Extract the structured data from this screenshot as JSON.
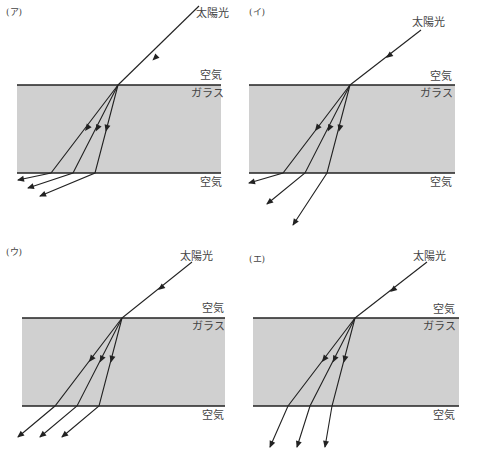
{
  "labels": {
    "sunlight": "太陽光",
    "air": "空気",
    "glass": "ガラス"
  },
  "colors": {
    "glass_fill": "#d0d0d0",
    "line": "#222222",
    "text": "#444444",
    "background": "#ffffff"
  },
  "panels": [
    {
      "id": "a",
      "label": "(ア)",
      "label_pos": [
        6,
        15
      ],
      "glass": {
        "x": 17,
        "y": 85,
        "w": 204,
        "h": 88
      },
      "incident": {
        "from": [
          199,
          6
        ],
        "to": [
          118,
          85
        ]
      },
      "incident_arrow_at": [
        156,
        57
      ],
      "sun_label_pos": [
        196,
        17
      ],
      "air_top_pos": [
        200,
        79
      ],
      "glass_label_pos": [
        191,
        97
      ],
      "air_bottom_pos": [
        200,
        186
      ],
      "rays": [
        {
          "bend": [
            51,
            173
          ],
          "end": [
            18,
            180
          ],
          "mid_arrow": [
            88,
            127
          ]
        },
        {
          "bend": [
            73,
            173
          ],
          "end": [
            28,
            188
          ],
          "mid_arrow": [
            98,
            127
          ]
        },
        {
          "bend": [
            95,
            173
          ],
          "end": [
            40,
            196
          ],
          "mid_arrow": [
            107,
            127
          ]
        }
      ]
    },
    {
      "id": "i",
      "label": "(イ)",
      "label_pos": [
        249,
        15
      ],
      "glass": {
        "x": 249,
        "y": 85,
        "w": 206,
        "h": 88
      },
      "incident": {
        "from": [
          421,
          30
        ],
        "to": [
          350,
          85
        ]
      },
      "incident_arrow_at": [
        390,
        55
      ],
      "sun_label_pos": [
        412,
        26
      ],
      "air_top_pos": [
        430,
        80
      ],
      "glass_label_pos": [
        420,
        97
      ],
      "air_bottom_pos": [
        430,
        186
      ],
      "rays": [
        {
          "bend": [
            283,
            173
          ],
          "end": [
            249,
            183
          ],
          "mid_arrow": [
            318,
            127
          ]
        },
        {
          "bend": [
            305,
            173
          ],
          "end": [
            267,
            204
          ],
          "mid_arrow": [
            330,
            127
          ]
        },
        {
          "bend": [
            327,
            173
          ],
          "end": [
            293,
            225
          ],
          "mid_arrow": [
            340,
            127
          ]
        }
      ]
    },
    {
      "id": "u",
      "label": "(ウ)",
      "label_pos": [
        6,
        255
      ],
      "glass": {
        "x": 22,
        "y": 318,
        "w": 203,
        "h": 88
      },
      "incident": {
        "from": [
          192,
          262
        ],
        "to": [
          122,
          318
        ]
      },
      "incident_arrow_at": [
        162,
        287
      ],
      "sun_label_pos": [
        180,
        260
      ],
      "air_top_pos": [
        202,
        312
      ],
      "glass_label_pos": [
        192,
        330
      ],
      "air_bottom_pos": [
        202,
        419
      ],
      "rays": [
        {
          "bend": [
            55,
            406
          ],
          "end": [
            18,
            437
          ],
          "mid_arrow": [
            92,
            358
          ]
        },
        {
          "bend": [
            77,
            406
          ],
          "end": [
            40,
            437
          ],
          "mid_arrow": [
            102,
            358
          ]
        },
        {
          "bend": [
            99,
            406
          ],
          "end": [
            62,
            437
          ],
          "mid_arrow": [
            112,
            358
          ]
        }
      ]
    },
    {
      "id": "e",
      "label": "(エ)",
      "label_pos": [
        249,
        262
      ],
      "glass": {
        "x": 253,
        "y": 318,
        "w": 206,
        "h": 88
      },
      "incident": {
        "from": [
          427,
          262
        ],
        "to": [
          355,
          318
        ]
      },
      "incident_arrow_at": [
        394,
        289
      ],
      "sun_label_pos": [
        413,
        260
      ],
      "air_top_pos": [
        433,
        313
      ],
      "glass_label_pos": [
        423,
        330
      ],
      "air_bottom_pos": [
        433,
        419
      ],
      "rays": [
        {
          "bend": [
            288,
            406
          ],
          "end": [
            270,
            447
          ],
          "mid_arrow": [
            325,
            358
          ]
        },
        {
          "bend": [
            310,
            406
          ],
          "end": [
            297,
            447
          ],
          "mid_arrow": [
            335,
            358
          ]
        },
        {
          "bend": [
            332,
            406
          ],
          "end": [
            325,
            447
          ],
          "mid_arrow": [
            345,
            358
          ]
        }
      ]
    }
  ]
}
